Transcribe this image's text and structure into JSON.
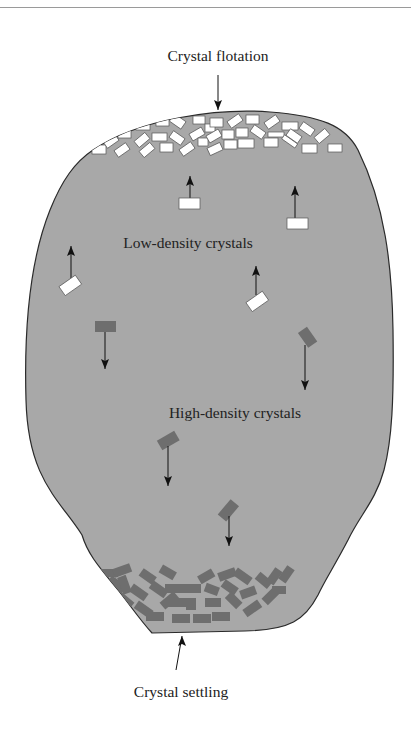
{
  "figure": {
    "labels": {
      "top": "Crystal flotation",
      "low_density": "Low-density crystals",
      "high_density": "High-density crystals",
      "bottom": "Crystal settling"
    },
    "colors": {
      "magma": "#a8a8a8",
      "outline": "#2a2a2a",
      "low_density_crystal": "#ffffff",
      "high_density_crystal": "#6e6e6e",
      "arrow": "#111111",
      "text": "#222222",
      "rule": "#9a9a9a"
    },
    "annotations": [
      {
        "text": "Crystal flotation",
        "arrow": "down",
        "target": "top crystal accumulation"
      },
      {
        "text": "Crystal settling",
        "arrow": "up",
        "target": "bottom crystal accumulation"
      }
    ],
    "crystal_groups": [
      {
        "name": "floating",
        "color": "white",
        "motion": "up"
      },
      {
        "name": "sinking",
        "color": "dark gray",
        "motion": "down"
      }
    ]
  }
}
